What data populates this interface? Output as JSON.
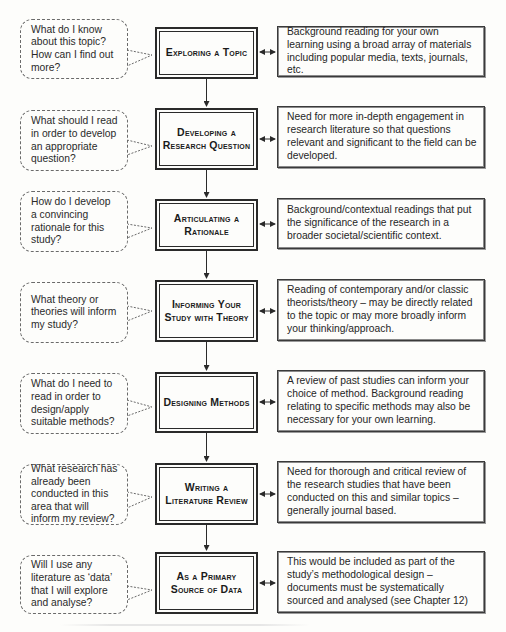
{
  "diagram": {
    "rows": [
      {
        "question": "What do I know about this topic? How can I find out more?",
        "stage": "Exploring a Topic",
        "description": "Background reading for your own learning using a broad array of materials including popular media, texts, journals, etc."
      },
      {
        "question": "What should I read in order to develop an appropriate question?",
        "stage": "Developing a Research Question",
        "description": "Need for more in-depth engagement in research literature so that questions relevant and significant to the field can be developed."
      },
      {
        "question": "How do I develop a convincing rationale for this study?",
        "stage": "Articulating a Rationale",
        "description": "Background/contextual readings that put the significance of the research in a broader societal/scientific context."
      },
      {
        "question": "What theory or theories will inform my study?",
        "stage": "Informing Your Study with Theory",
        "description": "Reading of contemporary and/or classic theorists/theory – may be directly related to the topic or may more broadly inform your thinking/approach."
      },
      {
        "question": "What do I need to read in order to design/apply suitable methods?",
        "stage": "Designing Methods",
        "description": "A review of past studies can inform your choice of method. Background reading relating to specific methods may also be necessary for your own learning."
      },
      {
        "question": "What research has already been conducted in this area that will inform my review?",
        "stage": "Writing a Literature Review",
        "description": "Need for thorough and critical review of the research studies that have been conducted on this and similar topics – generally journal based."
      },
      {
        "question": "Will I use any literature as ‘data’ that I will explore and analyse?",
        "stage": "As a Primary Source of Data",
        "description": "This would be included as part of the study’s methodological design – documents must be systematically sourced and analysed (see Chapter 12)"
      }
    ]
  }
}
